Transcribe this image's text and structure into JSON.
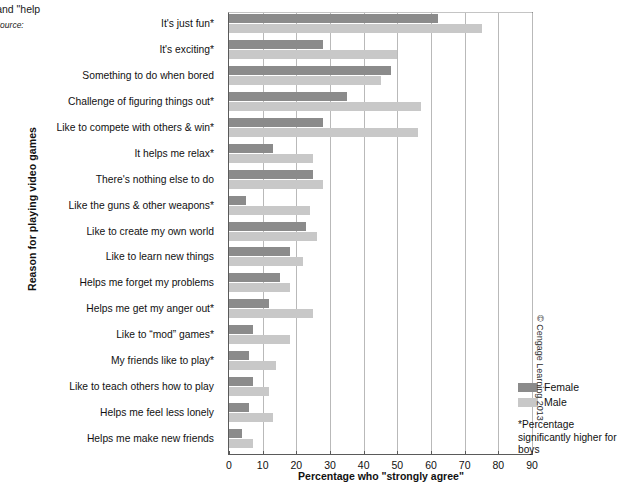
{
  "caption": {
    "line1": "e relax\" and \"help",
    "line2": "er out.\"",
    "source_label": "Source:",
    "line3": "on (2010)."
  },
  "chart_data": {
    "type": "bar",
    "orientation": "horizontal",
    "title": "",
    "xlabel": "Percentage who \"strongly agree\"",
    "ylabel": "Reason for playing video games",
    "xlim": [
      0,
      90
    ],
    "xticks": [
      0,
      10,
      20,
      30,
      40,
      50,
      60,
      70,
      80,
      90
    ],
    "grid": true,
    "legend_position": "right-bottom",
    "categories": [
      "It's just fun*",
      "It's exciting*",
      "Something to do when bored",
      "Challenge of figuring things out*",
      "Like to compete with others & win*",
      "It helps me relax*",
      "There's nothing else to do",
      "Like the guns & other weapons*",
      "Like to create my own world",
      "Like to learn new things",
      "Helps me forget my problems",
      "Helps me get my anger out*",
      "Like to “mod” games*",
      "My friends like to play*",
      "Like to teach others how to play",
      "Helps me feel less lonely",
      "Helps me make new friends"
    ],
    "series": [
      {
        "name": "Female",
        "color": "#8b8b8b",
        "values": [
          62,
          28,
          48,
          35,
          28,
          13,
          25,
          5,
          23,
          18,
          15,
          12,
          7,
          6,
          7,
          6,
          4
        ]
      },
      {
        "name": "Male",
        "color": "#c8c8c8",
        "values": [
          75,
          50,
          45,
          57,
          56,
          25,
          28,
          24,
          26,
          22,
          18,
          25,
          18,
          14,
          12,
          13,
          7
        ]
      }
    ],
    "annotations": {
      "footnote": "*Percentage significantly higher for boys"
    }
  },
  "legend": {
    "items": [
      {
        "label": "Female",
        "color": "#8b8b8b"
      },
      {
        "label": "Male",
        "color": "#c8c8c8"
      }
    ]
  },
  "footnote": "*Percentage significantly higher for boys",
  "copyright": "© Cengage Learning 2013"
}
